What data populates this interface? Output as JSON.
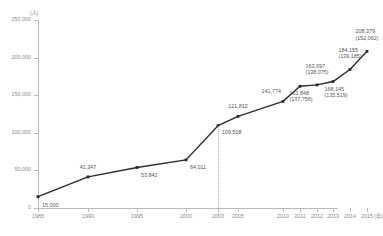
{
  "chart_data": {
    "type": "line",
    "title": "",
    "xlabel": "年",
    "ylabel": "(人)",
    "ylim": [
      0,
      250000
    ],
    "grid": false,
    "legend": "none",
    "y_ticks": [
      "250,000",
      "200,000",
      "150,000",
      "100,000",
      "50,000",
      "0"
    ],
    "y_tick_values": [
      250000,
      200000,
      150000,
      100000,
      50000,
      0
    ],
    "x_ticks": [
      "1985",
      "1990",
      "1995",
      "2000",
      "2003",
      "2005",
      "2010",
      "2011",
      "2012",
      "2013",
      "2014",
      "2015"
    ],
    "x_unit": "(年)",
    "y_unit": "(人)",
    "reference_line_year": "2003",
    "categories": [
      "1985",
      "1990",
      "1995",
      "2000",
      "2003",
      "2005",
      "2010",
      "2011",
      "2012",
      "2013",
      "2014",
      "2015"
    ],
    "values": [
      15000,
      41347,
      53842,
      64011,
      109508,
      121812,
      141774,
      161848,
      163697,
      168145,
      184155,
      208379
    ],
    "secondary_values": [
      null,
      null,
      null,
      null,
      null,
      null,
      null,
      137756,
      138075,
      135519,
      139185,
      152062
    ],
    "point_labels": [
      {
        "year": "1985",
        "main": "15,000",
        "sub": ""
      },
      {
        "year": "1990",
        "main": "41,347",
        "sub": ""
      },
      {
        "year": "1995",
        "main": "53,842",
        "sub": ""
      },
      {
        "year": "2000",
        "main": "64,011",
        "sub": ""
      },
      {
        "year": "2003",
        "main": "109,508",
        "sub": ""
      },
      {
        "year": "2005",
        "main": "121,812",
        "sub": ""
      },
      {
        "year": "2010",
        "main": "141,774",
        "sub": ""
      },
      {
        "year": "2011",
        "main": "161,848",
        "sub": "(137,756)"
      },
      {
        "year": "2012",
        "main": "163,697",
        "sub": "(138,075)"
      },
      {
        "year": "2013",
        "main": "168,145",
        "sub": "(135,519)"
      },
      {
        "year": "2014",
        "main": "184,155",
        "sub": "(139,185)"
      },
      {
        "year": "2015",
        "main": "208,379",
        "sub": "(152,062)"
      }
    ],
    "series_color": "#2b2b2b",
    "axis_color": "#b9b9b9",
    "text_color": "#8a8a8a"
  }
}
